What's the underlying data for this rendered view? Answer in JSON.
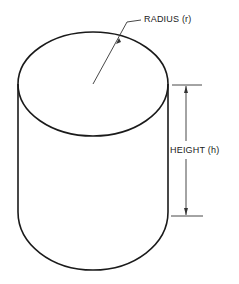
{
  "diagram": {
    "labels": {
      "radius": "RADIUS (r)",
      "height": "HEIGHT (h)"
    },
    "colors": {
      "stroke": "#1a1a1a",
      "dimension": "#333333",
      "background": "#ffffff"
    }
  }
}
